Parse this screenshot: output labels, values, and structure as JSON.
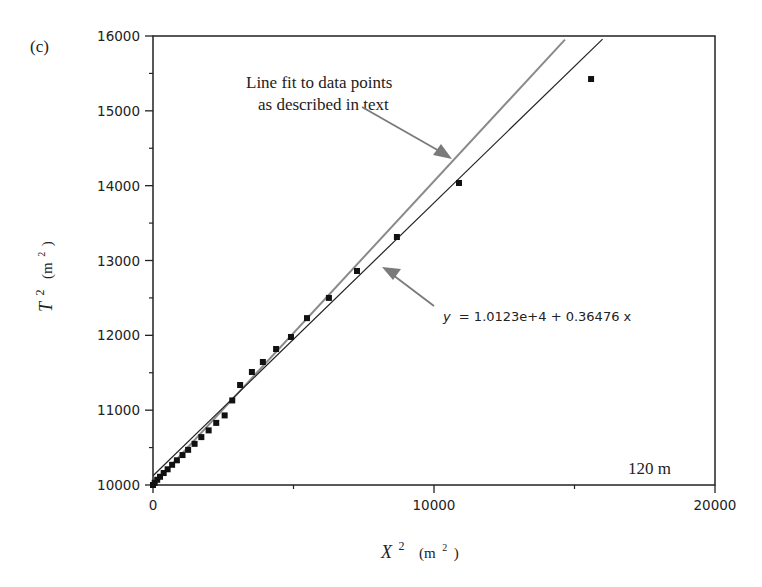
{
  "panel_label": "(c)",
  "chart_data": {
    "type": "scatter",
    "title": "",
    "xlabel": "X² (m²)",
    "ylabel": "T² (m²)",
    "xlim": [
      0,
      20000
    ],
    "ylim": [
      10000,
      16000
    ],
    "x_ticks": [
      0,
      10000,
      20000
    ],
    "x_tick_labels": [
      "0",
      "10000",
      "20000"
    ],
    "x_minor_ticks": [
      5000,
      15000
    ],
    "y_ticks": [
      10000,
      11000,
      12000,
      13000,
      14000,
      15000,
      16000
    ],
    "y_tick_labels": [
      "10000",
      "11000",
      "12000",
      "13000",
      "14000",
      "15000",
      "16000"
    ],
    "y_minor_ticks": [
      10500,
      11500,
      12500,
      13500,
      14500,
      15500
    ],
    "grid": false,
    "legend": null,
    "series": [
      {
        "name": "data points",
        "type": "scatter",
        "marker": "square",
        "color": "#111111",
        "x": [
          0,
          60,
          150,
          250,
          380,
          520,
          680,
          850,
          1050,
          1250,
          1480,
          1720,
          1980,
          2250,
          2550,
          2820,
          3100,
          3520,
          3910,
          4380,
          4910,
          5480,
          6260,
          7260,
          8680,
          10890,
          15590
        ],
        "y": [
          10000,
          10030,
          10070,
          10110,
          10160,
          10210,
          10270,
          10330,
          10400,
          10470,
          10550,
          10640,
          10730,
          10830,
          10930,
          11130,
          11336,
          11510,
          11644,
          11817,
          11978,
          12230,
          12500,
          12860,
          13314,
          14036,
          15425
        ]
      },
      {
        "name": "linear regression",
        "type": "line",
        "color": "#222222",
        "equation": "y = 1.0123e+4 + 0.36476 x",
        "intercept": 10123,
        "slope": 0.36476,
        "x": [
          0,
          16000
        ],
        "y": [
          10123,
          15959
        ]
      },
      {
        "name": "Line fit to data points as described in text",
        "type": "line",
        "color": "#8a8a8a",
        "intercept": 10000,
        "slope": 0.406,
        "x": [
          0,
          14660
        ],
        "y": [
          10000,
          15952
        ]
      }
    ],
    "annotations": [
      {
        "text": "Line fit to data points",
        "line": 1
      },
      {
        "text": "as described in text",
        "line": 2
      },
      {
        "text": "y = 1.0123e+4 + 0.36476 x"
      },
      {
        "text": "120 m"
      }
    ]
  },
  "labels": {
    "annotation_line1": "Line fit to data points",
    "annotation_line2": "as described in text",
    "equation_y": "y",
    "equation_rest": "= 1.0123e+4 + 0.36476 x",
    "distance": "120 m",
    "xlabel_main": "X",
    "xlabel_sup": "2",
    "xlabel_unit_open": "(m",
    "xlabel_unit_sup": "2",
    "xlabel_unit_close": ")",
    "ylabel_main": "T",
    "ylabel_sup": "2",
    "ylabel_unit_open": "(m",
    "ylabel_unit_sup": "2",
    "ylabel_unit_close": ")"
  },
  "colors": {
    "axis": "#222222",
    "regression_line": "#222222",
    "text_fit_line": "#8a8a8a",
    "arrow": "#7a7a7a",
    "points": "#111111"
  }
}
